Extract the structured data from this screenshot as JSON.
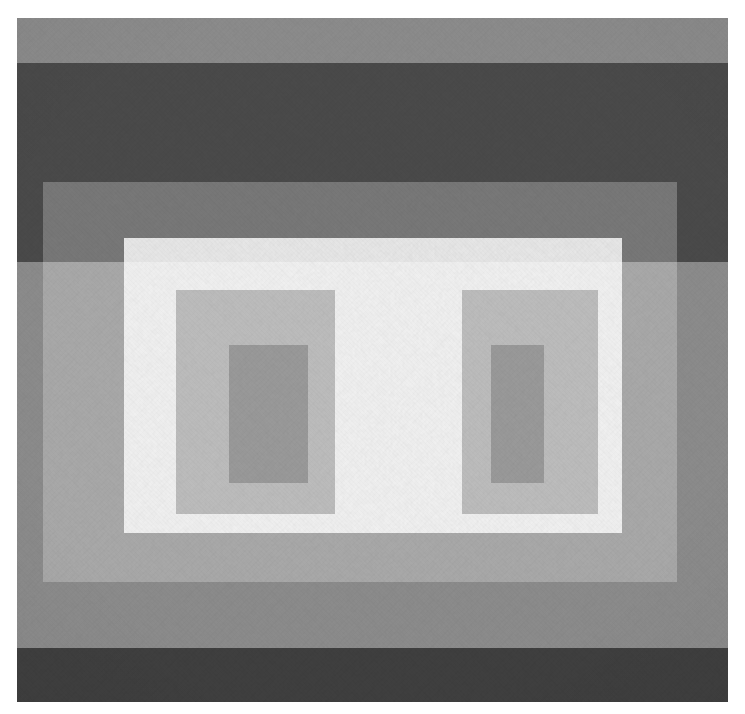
{
  "artwork": {
    "title": "Untitled (Variant / Adobe study)",
    "style": "Geometric abstraction — nested rectangle variant",
    "medium_appearance": "flat matte bands on textured board",
    "palette_name": "neutral greyscale",
    "canvas": {
      "width": 745,
      "height": 714,
      "background": "#ffffff"
    },
    "panel": {
      "label": "painted-panel",
      "x": 17,
      "y": 18,
      "width": 711,
      "height": 684,
      "border_margin_color": "#ffffff"
    },
    "bands": [
      {
        "name": "top-light-band",
        "color": "#8c8c8c",
        "x": 0,
        "y": 0,
        "width": 711,
        "height": 45
      },
      {
        "name": "upper-dark-band",
        "color": "#4a4a4a",
        "x": 0,
        "y": 45,
        "width": 711,
        "height": 199
      },
      {
        "name": "middle-light-band",
        "color": "#8c8c8c",
        "x": 0,
        "y": 244,
        "width": 711,
        "height": 386
      },
      {
        "name": "lower-dark-band",
        "color": "#3f3f3f",
        "x": 0,
        "y": 630,
        "width": 711,
        "height": 54
      }
    ],
    "films": [
      {
        "name": "outer-grey-film",
        "color": "#ffffff",
        "opacity": 0.26,
        "x": 26,
        "y": 164,
        "width": 634,
        "height": 400
      },
      {
        "name": "inner-pale-film",
        "color": "#ffffff",
        "opacity": 0.82,
        "x": 107,
        "y": 220,
        "width": 498,
        "height": 295
      }
    ],
    "shapes": [
      {
        "name": "left-inner-bracket",
        "role": "mid-grey upright",
        "color": "#bdbdbd",
        "x": 159,
        "y": 272,
        "width": 159,
        "height": 224
      },
      {
        "name": "right-inner-bracket",
        "role": "mid-grey upright",
        "color": "#bdbdbd",
        "x": 445,
        "y": 272,
        "width": 136,
        "height": 224
      },
      {
        "name": "left-core-rectangle",
        "role": "dark grey core",
        "color": "#9a9a9a",
        "x": 212,
        "y": 327,
        "width": 79,
        "height": 138
      },
      {
        "name": "right-core-rectangle",
        "role": "dark grey core",
        "color": "#9a9a9a",
        "x": 474,
        "y": 327,
        "width": 53,
        "height": 138
      }
    ],
    "colors": {
      "paper_white": "#ffffff",
      "band_light": "#8c8c8c",
      "band_dark_upper": "#4a4a4a",
      "band_dark_lower": "#3f3f3f",
      "film_bright": "#f4f4f4",
      "shape_mid_grey": "#bdbdbd",
      "shape_core_grey": "#9a9a9a"
    }
  }
}
